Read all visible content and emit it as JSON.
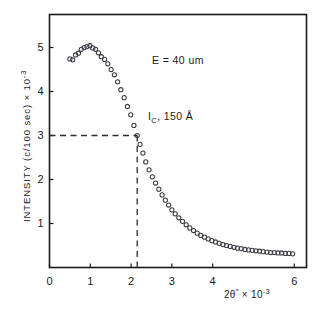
{
  "figure": {
    "name": "rocking-curve-plot",
    "background_color": "#ffffff",
    "frame_color": "#1a1a1a"
  },
  "chart_data": {
    "type": "scatter",
    "title": "",
    "subtitle": "",
    "xlabel": "2θ″ × 10⁻³",
    "xlabel_parts": {
      "base": "2θ",
      "prime": "″",
      "times": "× 10",
      "exponent": "-3"
    },
    "ylabel": "INTENSITY (c/100 sec) × 10⁻³",
    "ylabel_parts": {
      "base": "INTENSITY (c/100 sec) × 10",
      "exponent": "-3"
    },
    "xlim": [
      0,
      6.3
    ],
    "ylim": [
      0,
      5.75
    ],
    "xticks": [
      0,
      1,
      2,
      3,
      4,
      6
    ],
    "xtick_labels": [
      "0",
      "1",
      "2",
      "3",
      "4",
      "6"
    ],
    "yticks": [
      1,
      2,
      3,
      4,
      5
    ],
    "ytick_labels": [
      "1",
      "2",
      "3",
      "4",
      "5"
    ],
    "grid": false,
    "legend": null,
    "marker": "open-circle",
    "marker_color": "#3c3c46",
    "marker_radius": 2.1,
    "series": [
      {
        "name": "intensity",
        "x": [
          0.5,
          0.57,
          0.64,
          0.71,
          0.78,
          0.85,
          0.92,
          0.99,
          1.06,
          1.13,
          1.2,
          1.27,
          1.35,
          1.43,
          1.51,
          1.59,
          1.67,
          1.75,
          1.83,
          1.91,
          1.99,
          2.07,
          2.15,
          2.22,
          2.29,
          2.36,
          2.44,
          2.52,
          2.6,
          2.68,
          2.76,
          2.84,
          2.92,
          3.0,
          3.08,
          3.17,
          3.26,
          3.35,
          3.44,
          3.53,
          3.62,
          3.71,
          3.8,
          3.89,
          3.98,
          4.07,
          4.16,
          4.25,
          4.34,
          4.43,
          4.52,
          4.61,
          4.7,
          4.79,
          4.88,
          4.97,
          5.06,
          5.15,
          5.24,
          5.33,
          5.42,
          5.51,
          5.6,
          5.69,
          5.78,
          5.87,
          5.96
        ],
        "y": [
          4.74,
          4.72,
          4.83,
          4.87,
          4.96,
          5.0,
          5.02,
          5.04,
          4.99,
          4.96,
          4.88,
          4.79,
          4.73,
          4.63,
          4.5,
          4.38,
          4.22,
          4.04,
          3.86,
          3.66,
          3.47,
          3.23,
          3.0,
          2.8,
          2.6,
          2.4,
          2.22,
          2.06,
          1.92,
          1.78,
          1.65,
          1.53,
          1.42,
          1.31,
          1.22,
          1.13,
          1.05,
          0.97,
          0.9,
          0.84,
          0.78,
          0.73,
          0.69,
          0.65,
          0.61,
          0.58,
          0.55,
          0.52,
          0.5,
          0.48,
          0.46,
          0.44,
          0.43,
          0.41,
          0.4,
          0.39,
          0.38,
          0.37,
          0.36,
          0.35,
          0.34,
          0.34,
          0.33,
          0.33,
          0.32,
          0.32,
          0.31
        ]
      }
    ],
    "reference_lines": [
      {
        "name": "half-intensity-horizontal",
        "orientation": "horizontal",
        "value": 3.0,
        "style": "dashed",
        "x_from": 0.0,
        "x_to": 2.15
      },
      {
        "name": "critical-angle-vertical",
        "orientation": "vertical",
        "value": 2.15,
        "style": "dashed",
        "y_from": 0.0,
        "y_to": 3.0
      }
    ],
    "annotations": [
      {
        "name": "beam-energy",
        "text": "E = 40 um",
        "parts": {
          "symbol": "E",
          "equals": "=",
          "value": "40",
          "unit": "um"
        },
        "x": 2.4,
        "y": 4.6
      },
      {
        "name": "critical-thickness",
        "text": "I C , 150 Å",
        "parts": {
          "symbol": "I",
          "subscript": "C",
          "separator": ",",
          "value": "150",
          "unit": "Å"
        },
        "x": 2.3,
        "y": 3.45
      }
    ]
  },
  "annotations": {
    "energy": {
      "symbol": "E",
      "equals": "=",
      "value": "40",
      "unit": "um"
    },
    "ic": {
      "symbol": "I",
      "subscript": "C",
      "rest": ", 150 Å"
    }
  },
  "axes": {
    "x_title_base": "2θ",
    "x_title_prime": "″",
    "x_title_mid": "× 10",
    "x_title_exp": "-3",
    "y_title_base": "INTENSITY (c/100 sec) × 10",
    "y_title_exp": "-3"
  }
}
